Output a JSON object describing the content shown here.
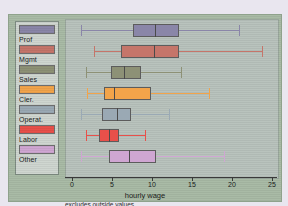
{
  "legend": {
    "items": [
      {
        "label": "Prof",
        "color": "#8a86a8"
      },
      {
        "label": "Mgmt",
        "color": "#c5756a"
      },
      {
        "label": "Sales",
        "color": "#8d9176"
      },
      {
        "label": "Cler.",
        "color": "#f2a44a"
      },
      {
        "label": "Operat.",
        "color": "#9aa9b4"
      },
      {
        "label": "Labor",
        "color": "#e8504a"
      },
      {
        "label": "Other",
        "color": "#cfa6d2"
      }
    ]
  },
  "chart_data": {
    "type": "box",
    "title": "",
    "xlabel": "hourly wage",
    "ylabel": "",
    "note": "excludes outside values",
    "xlim": [
      -1,
      26
    ],
    "ticks": [
      0,
      5,
      10,
      15,
      20,
      25
    ],
    "grid": false,
    "orientation": "horizontal",
    "categories": [
      "Prof",
      "Mgmt",
      "Sales",
      "Cler.",
      "Operat.",
      "Labor",
      "Other"
    ],
    "boxes": [
      {
        "name": "Prof",
        "whisker_low": 1.1,
        "q1": 7.6,
        "median": 10.4,
        "q3": 13.4,
        "whisker_high": 20.9,
        "color": "#8a86a8"
      },
      {
        "name": "Mgmt",
        "whisker_low": 2.8,
        "q1": 6.1,
        "median": 10.3,
        "q3": 13.4,
        "whisker_high": 23.8,
        "color": "#c5756a"
      },
      {
        "name": "Sales",
        "whisker_low": 1.8,
        "q1": 4.9,
        "median": 6.5,
        "q3": 8.6,
        "whisker_high": 13.6,
        "color": "#8d9176"
      },
      {
        "name": "Cler.",
        "whisker_low": 1.9,
        "q1": 4.0,
        "median": 5.3,
        "q3": 9.9,
        "whisker_high": 17.1,
        "color": "#f2a44a"
      },
      {
        "name": "Operat.",
        "whisker_low": 1.1,
        "q1": 3.8,
        "median": 5.6,
        "q3": 7.4,
        "whisker_high": 12.1,
        "color": "#9aa9b4"
      },
      {
        "name": "Labor",
        "whisker_low": 1.8,
        "q1": 3.4,
        "median": 4.6,
        "q3": 5.9,
        "whisker_high": 9.1,
        "color": "#e8504a"
      },
      {
        "name": "Other",
        "whisker_low": 1.1,
        "q1": 4.6,
        "median": 7.1,
        "q3": 10.5,
        "whisker_high": 19.0,
        "color": "#cfa6d2"
      }
    ]
  }
}
